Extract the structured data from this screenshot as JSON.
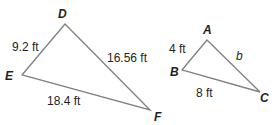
{
  "triangles": [
    {
      "name": "DEF",
      "vertices": {
        "D": {
          "label": "D",
          "x": 65,
          "y": 24
        },
        "E": {
          "label": "E",
          "x": 22,
          "y": 75
        },
        "F": {
          "label": "F",
          "x": 150,
          "y": 110
        }
      },
      "sides": {
        "DE": "9.2 ft",
        "DF": "16.56 ft",
        "EF": "18.4 ft"
      }
    },
    {
      "name": "ABC",
      "vertices": {
        "A": {
          "label": "A",
          "x": 207,
          "y": 40
        },
        "B": {
          "label": "B",
          "x": 182,
          "y": 70
        },
        "C": {
          "label": "C",
          "x": 260,
          "y": 92
        }
      },
      "sides": {
        "AB": "4 ft",
        "AC": "b",
        "BC": "8 ft"
      }
    }
  ],
  "colors": {
    "edge": "#808080",
    "text": "#231f20"
  }
}
